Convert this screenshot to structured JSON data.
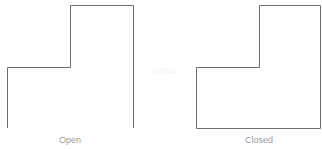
{
  "diagram": {
    "shapes": [
      {
        "name": "open-polyline",
        "label": "Open",
        "closed": false,
        "points": [
          [
            7,
            128
          ],
          [
            7,
            67
          ],
          [
            70,
            67
          ],
          [
            70,
            5
          ],
          [
            133,
            5
          ],
          [
            133,
            128
          ]
        ]
      },
      {
        "name": "closed-polygon",
        "label": "Closed",
        "closed": true,
        "points": [
          [
            196,
            128
          ],
          [
            196,
            67
          ],
          [
            259,
            67
          ],
          [
            259,
            5
          ],
          [
            321,
            5
          ],
          [
            321,
            128
          ]
        ]
      }
    ],
    "center_watermark": "Symbol",
    "stroke_color": "#6e6e6e",
    "label_color": "#9a9a9a"
  }
}
